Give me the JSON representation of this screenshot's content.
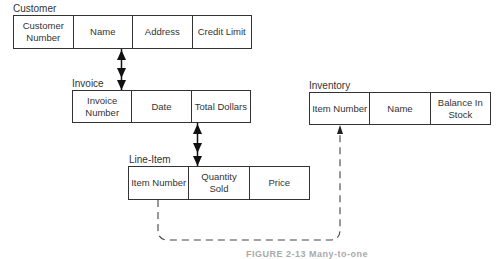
{
  "entities": [
    {
      "name": "Customer",
      "fields": [
        "Customer Number",
        "Name",
        "Address",
        "Credit Limit"
      ]
    },
    {
      "name": "Invoice",
      "fields": [
        "Invoice Number",
        "Date",
        "Total Dollars"
      ]
    },
    {
      "name": "Line-Item",
      "fields": [
        "Item Number",
        "Quantity Sold",
        "Price"
      ]
    },
    {
      "name": "Inventory",
      "fields": [
        "Item Number",
        "Name",
        "Balance In Stock"
      ]
    }
  ],
  "relationships": [
    {
      "from": "Customer",
      "to": "Invoice",
      "type": "one-to-many",
      "style": "solid"
    },
    {
      "from": "Invoice",
      "to": "Line-Item",
      "type": "one-to-many",
      "style": "solid"
    },
    {
      "from": "Line-Item.Item Number",
      "to": "Inventory.Item Number",
      "type": "reference",
      "style": "dashed"
    }
  ],
  "caption": "FIGURE 2-13  Many-to-one"
}
